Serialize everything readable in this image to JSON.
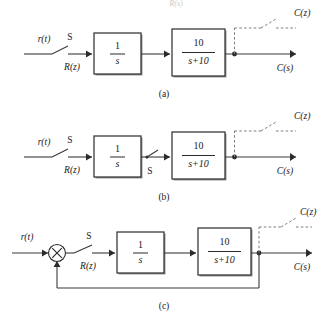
{
  "figure": {
    "top_partial_text": "R(s)",
    "panels": [
      {
        "id": "a",
        "caption": "(a)",
        "input_label": "r(t)",
        "switch_label": "S",
        "sampled_label": "R(z)",
        "block1_num": "1",
        "block1_den": "s",
        "block2_num": "10",
        "block2_den": "s+10",
        "output_label": "C(s)",
        "sampled_output_label": "C(z)",
        "mid_switch_label": "",
        "has_mid_switch": false,
        "has_feedback": false,
        "has_summing_junction": false
      },
      {
        "id": "b",
        "caption": "(b)",
        "input_label": "r(t)",
        "switch_label": "S",
        "sampled_label": "R(z)",
        "block1_num": "1",
        "block1_den": "s",
        "block2_num": "10",
        "block2_den": "s+10",
        "output_label": "C(s)",
        "sampled_output_label": "C(z)",
        "mid_switch_label": "S",
        "has_mid_switch": true,
        "has_feedback": false,
        "has_summing_junction": false
      },
      {
        "id": "c",
        "caption": "(c)",
        "input_label": "r(t)",
        "switch_label": "S",
        "sampled_label": "R(z)",
        "block1_num": "1",
        "block1_den": "s",
        "block2_num": "10",
        "block2_den": "s+10",
        "output_label": "C(s)",
        "sampled_output_label": "C(z)",
        "mid_switch_label": "",
        "has_mid_switch": false,
        "has_feedback": true,
        "has_summing_junction": true,
        "summing_symbol": "×"
      }
    ]
  },
  "colors": {
    "wire": "#3a3a3a",
    "dashed_wire": "#7d7d7d",
    "block_stroke": "#2b2b2b",
    "block_fill": "#ffffff",
    "background": "#ffffff",
    "text": "#1a1a1a"
  }
}
